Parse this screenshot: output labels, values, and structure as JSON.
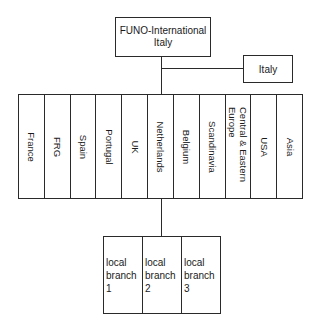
{
  "diagram": {
    "root": {
      "line1": "FUNO-International",
      "line2": "Italy"
    },
    "side_node": {
      "label": "Italy"
    },
    "countries": [
      {
        "label": "France"
      },
      {
        "label": "FRG"
      },
      {
        "label": "Spain"
      },
      {
        "label": "Portugal"
      },
      {
        "label": "UK"
      },
      {
        "label": "Netherlands"
      },
      {
        "label": "Belgium"
      },
      {
        "label": "Scandinavia"
      },
      {
        "label": "Central & Eastern Europe"
      },
      {
        "label": "USA"
      },
      {
        "label": "Asia"
      }
    ],
    "branches": [
      {
        "line1": "local",
        "line2": "branch 1"
      },
      {
        "line1": "local",
        "line2": "branch 2"
      },
      {
        "line1": "local",
        "line2": "branch 3"
      }
    ]
  }
}
